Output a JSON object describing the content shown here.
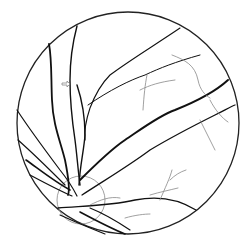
{
  "figure": {
    "subject": "retinal fundus vessel tracing",
    "annotation": "arrow-marker",
    "colors": {
      "background": "#ffffff",
      "major_vessel": "#111111",
      "minor_vessel": "#555555",
      "fine_vessel": "#888888",
      "optic_disc": "#777777"
    }
  }
}
